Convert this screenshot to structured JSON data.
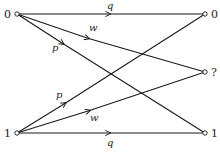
{
  "diagram": {
    "type": "binary-erasure-channel-transition-diagram",
    "inputs": [
      {
        "id": "in0",
        "label": "0",
        "x": 17,
        "y": 14
      },
      {
        "id": "in1",
        "label": "1",
        "x": 17,
        "y": 133
      }
    ],
    "outputs": [
      {
        "id": "out0",
        "label": "0",
        "x": 205,
        "y": 14
      },
      {
        "id": "outE",
        "label": "?",
        "x": 205,
        "y": 72
      },
      {
        "id": "out1",
        "label": "1",
        "x": 205,
        "y": 133
      }
    ],
    "edges": [
      {
        "from": "in0",
        "to": "out0",
        "label": "q"
      },
      {
        "from": "in0",
        "to": "outE",
        "label": "w"
      },
      {
        "from": "in0",
        "to": "out1",
        "label": "p"
      },
      {
        "from": "in1",
        "to": "out0",
        "label": "p"
      },
      {
        "from": "in1",
        "to": "outE",
        "label": "w"
      },
      {
        "from": "in1",
        "to": "out1",
        "label": "q"
      }
    ]
  }
}
